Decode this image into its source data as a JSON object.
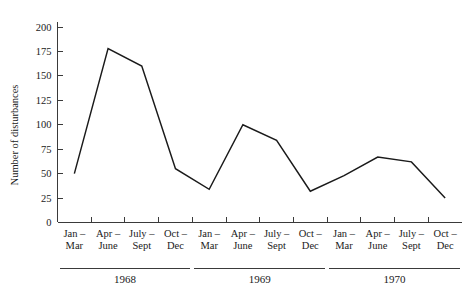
{
  "figure": {
    "caption": ""
  },
  "axes": {
    "ylabel": "Number of disturbances",
    "xlabel": ""
  },
  "chart_data": {
    "type": "line",
    "title": "",
    "xlabel": "",
    "ylabel": "Number of disturbances",
    "ylim": [
      0,
      200
    ],
    "yticks": [
      0,
      25,
      50,
      75,
      100,
      125,
      150,
      175,
      200
    ],
    "ytick_labels": [
      "0",
      "25",
      "50",
      "75",
      "100",
      "125",
      "150",
      "175",
      "200"
    ],
    "grid": false,
    "legend": "none",
    "categories": [
      "Jan – Mar",
      "Apr – June",
      "July – Sept",
      "Oct – Dec",
      "Jan – Mar",
      "Apr – June",
      "July – Sept",
      "Oct – Dec",
      "Jan – Mar",
      "Apr – June",
      "July – Sept",
      "Oct – Dec"
    ],
    "xtick_lines": [
      [
        "Jan –",
        "Mar"
      ],
      [
        "Apr –",
        "June"
      ],
      [
        "July –",
        "Sept"
      ],
      [
        "Oct –",
        "Dec"
      ],
      [
        "Jan –",
        "Mar"
      ],
      [
        "Apr –",
        "June"
      ],
      [
        "July –",
        "Sept"
      ],
      [
        "Oct –",
        "Dec"
      ],
      [
        "Jan –",
        "Mar"
      ],
      [
        "Apr –",
        "June"
      ],
      [
        "July –",
        "Sept"
      ],
      [
        "Oct –",
        "Dec"
      ]
    ],
    "values": [
      50,
      178,
      160,
      55,
      34,
      100,
      84,
      32,
      48,
      67,
      62,
      25
    ],
    "year_groups": [
      {
        "label": "1968",
        "start_index": 0,
        "end_index": 3
      },
      {
        "label": "1969",
        "start_index": 4,
        "end_index": 7
      },
      {
        "label": "1970",
        "start_index": 8,
        "end_index": 11
      }
    ],
    "line_color": "#1a1a1a",
    "axis_color": "#3a3a3a"
  }
}
